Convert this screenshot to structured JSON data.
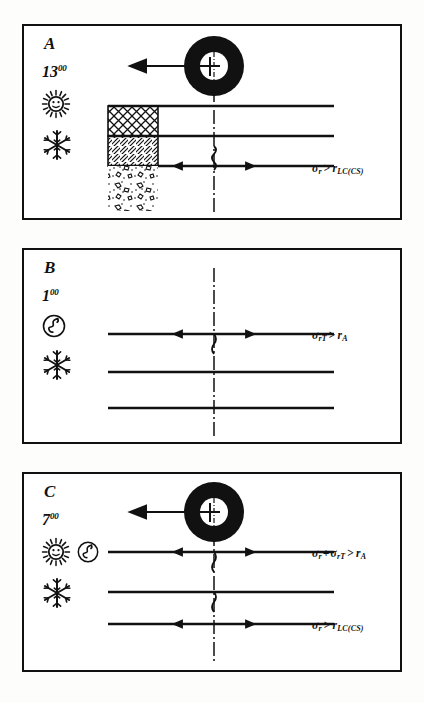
{
  "figure": {
    "type": "technical-diagram",
    "background": "#fdfdfb",
    "ink": "#111111"
  },
  "panels": [
    {
      "id": "A",
      "letter": "A",
      "time": "13",
      "time_sup": "00",
      "icons": [
        "sun-icon",
        "snowflake-icon"
      ],
      "has_ring": true,
      "ring_label": "borehole-ring",
      "layers": [
        {
          "name": "cross-hatch-layer",
          "pattern": "crosshatch"
        },
        {
          "name": "diagonal-hatch-layer",
          "pattern": "diagonal"
        },
        {
          "name": "gravel-layer",
          "pattern": "stipple"
        }
      ],
      "cracks": 1,
      "formulas": [
        {
          "lhs": "σ",
          "lhs_sub": "r",
          "op": ">",
          "rhs": "r",
          "rhs_sub": "LC(CS)"
        }
      ]
    },
    {
      "id": "B",
      "letter": "B",
      "time": "1",
      "time_sup": "00",
      "icons": [
        "moon-icon",
        "snowflake-icon"
      ],
      "has_ring": false,
      "layers": [],
      "cracks": 1,
      "formulas": [
        {
          "lhs": "σ",
          "lhs_sub": "rT",
          "op": ">",
          "rhs": "r",
          "rhs_sub": "A"
        }
      ]
    },
    {
      "id": "C",
      "letter": "C",
      "time": "7",
      "time_sup": "00",
      "icons": [
        "sun-icon",
        "moon-icon",
        "snowflake-icon"
      ],
      "has_ring": true,
      "ring_label": "borehole-ring",
      "layers": [],
      "cracks": 2,
      "formulas": [
        {
          "lhs": "σ",
          "lhs_sub": "r",
          "plus": "+",
          "lhs2": "σ",
          "lhs2_sub": "rT",
          "op": ">",
          "rhs": "r",
          "rhs_sub": "A"
        },
        {
          "lhs": "σ",
          "lhs_sub": "r",
          "op": ">",
          "rhs": "r",
          "rhs_sub": "LC(CS)"
        }
      ]
    }
  ],
  "symbols": {
    "sigma": "σ",
    "greater_than": ">",
    "plus": "+"
  }
}
